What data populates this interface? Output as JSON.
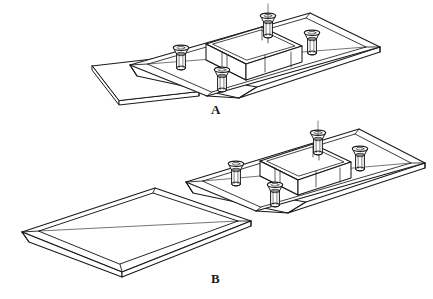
{
  "figure": {
    "type": "isometric-engineering-assembly-drawing",
    "background_color": "#ffffff",
    "line_color": "#1a1a1a",
    "panels": [
      {
        "id": "A",
        "label": "A",
        "description": "Assembly step A: base plate with raised central boss and four countersunk screws, thin cover plate positioned below-left at a tilt, partially overlapping the base plate",
        "components": [
          {
            "name": "base-plate",
            "shape": "rectangular chamfered plate",
            "count": 1
          },
          {
            "name": "central-boss",
            "shape": "raised rounded-corner rectangular block",
            "count": 1
          },
          {
            "name": "screw",
            "shape": "countersunk flat head screw",
            "count": 4
          },
          {
            "name": "cover-plate",
            "shape": "thin flat plate with chamfered edge",
            "count": 1
          }
        ]
      },
      {
        "id": "B",
        "label": "B",
        "description": "Assembly step B: base plate with raised central boss and four countersunk screws at upper right, thin cover plate fully separated at lower left",
        "components": [
          {
            "name": "base-plate",
            "shape": "rectangular chamfered plate",
            "count": 1
          },
          {
            "name": "central-boss",
            "shape": "raised rounded-corner rectangular block",
            "count": 1
          },
          {
            "name": "screw",
            "shape": "countersunk flat head screw",
            "count": 4
          },
          {
            "name": "cover-plate",
            "shape": "thin flat tray-like plate with chamfered edges",
            "count": 1
          }
        ]
      }
    ],
    "colors": {
      "stroke": "#1a1a1a",
      "fill": "#ffffff",
      "label_color": "#1a1a1a"
    },
    "stroke_widths": {
      "outline": 1.1,
      "detail": 0.9,
      "thin": 0.7
    }
  }
}
